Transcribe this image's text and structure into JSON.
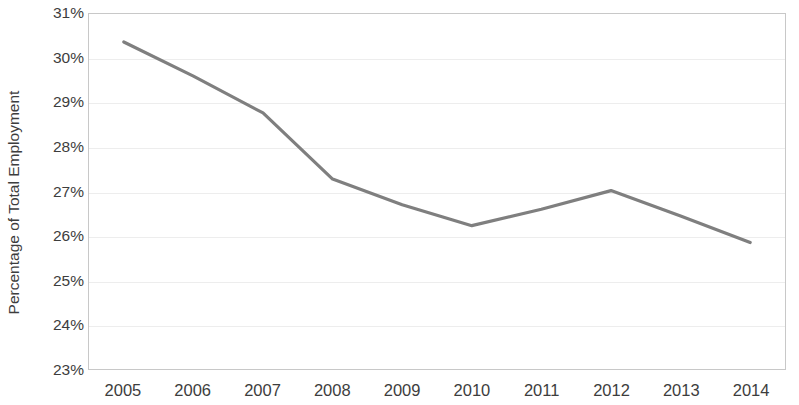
{
  "chart_data": {
    "type": "line",
    "title": "",
    "xlabel": "",
    "ylabel": "Percentage of Total Employment",
    "categories": [
      "2005",
      "2006",
      "2007",
      "2008",
      "2009",
      "2010",
      "2011",
      "2012",
      "2013",
      "2014"
    ],
    "x": [
      2005,
      2006,
      2007,
      2008,
      2009,
      2010,
      2011,
      2012,
      2013,
      2014
    ],
    "series": [
      {
        "name": "Percentage of Total Employment",
        "values": [
          30.37,
          29.6,
          28.77,
          27.28,
          26.7,
          26.23,
          26.6,
          27.02,
          26.45,
          25.85
        ],
        "color": "#7f7f7f",
        "line_width": 3.2,
        "markers": false
      }
    ],
    "ylim": [
      23,
      31
    ],
    "yticks": [
      23,
      24,
      25,
      26,
      27,
      28,
      29,
      30,
      31
    ],
    "ytick_labels": [
      "23%",
      "24%",
      "25%",
      "26%",
      "27%",
      "28%",
      "29%",
      "30%",
      "31%"
    ],
    "ytick_format": "percent",
    "grid": {
      "horizontal": true,
      "vertical": false,
      "color": "#ededed"
    },
    "legend": {
      "visible": false,
      "position": "none"
    },
    "plot_border": {
      "visible": true,
      "color": "#c8c8c8"
    },
    "annotations": []
  },
  "colors": {
    "line": "#7f7f7f",
    "gridline": "#ededed",
    "border": "#c8c8c8",
    "text": "#3d3d3d",
    "background": "#ffffff"
  }
}
